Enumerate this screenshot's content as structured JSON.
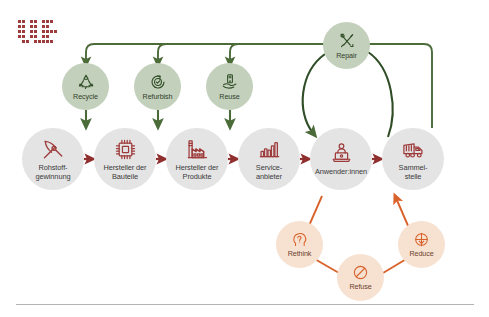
{
  "diagram": {
    "colors": {
      "chain_circle": "#e4e4e4",
      "chain_icon": "#9e3b3b",
      "green_circle": "#c3d0bb",
      "green_line": "#4b6b39",
      "orange_circle": "#f7e2d2",
      "orange_line": "#d9622b",
      "background": "#ffffff",
      "rule": "#b4b4b4"
    },
    "logo": {
      "name": "pixel-logo",
      "color": "#9e3b3b"
    },
    "chain": {
      "name": "value-chain",
      "nodes": [
        {
          "id": "rohstoffgewinnung",
          "label": "Rohstoff-\ngewinnung",
          "icon": "pickaxe-icon"
        },
        {
          "id": "hersteller-bauteile",
          "label": "Hersteller der\nBauteile",
          "icon": "microchip-icon"
        },
        {
          "id": "hersteller-produkte",
          "label": "Hersteller der\nProdukte",
          "icon": "factory-icon"
        },
        {
          "id": "serviceanbieter",
          "label": "Service-\nanbieter",
          "icon": "bar-chart-icon"
        },
        {
          "id": "anwender-innen",
          "label": "Anwender:innen",
          "icon": "user-laptop-icon"
        },
        {
          "id": "sammelstelle",
          "label": "Sammel-\nstelle",
          "icon": "garbage-truck-icon"
        }
      ]
    },
    "r_strategies_green": {
      "name": "recovery-strategies",
      "nodes": [
        {
          "id": "recycle",
          "label": "Recycle",
          "icon": "recycling-symbol-icon"
        },
        {
          "id": "refurbish",
          "label": "Refurbish",
          "icon": "clock-arrows-icon"
        },
        {
          "id": "reuse",
          "label": "Reuse",
          "icon": "hand-device-icon"
        },
        {
          "id": "repair",
          "label": "Repair",
          "icon": "tools-cross-icon"
        }
      ]
    },
    "r_strategies_orange": {
      "name": "reduction-strategies",
      "nodes": [
        {
          "id": "rethink",
          "label": "Rethink",
          "icon": "head-question-icon"
        },
        {
          "id": "refuse",
          "label": "Refuse",
          "icon": "prohibition-icon"
        },
        {
          "id": "reduce",
          "label": "Reduce",
          "icon": "target-down-arrow-icon"
        }
      ]
    }
  }
}
